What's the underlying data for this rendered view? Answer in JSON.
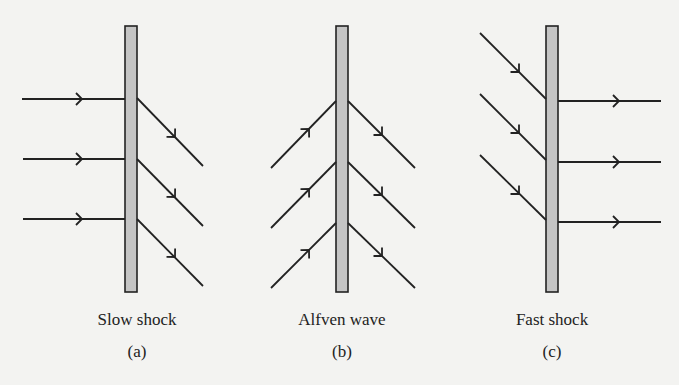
{
  "colors": {
    "background": "#f3f3f1",
    "line": "#222222",
    "bar_fill": "#c4c4c4"
  },
  "panels": [
    {
      "id": "a",
      "title": "Slow shock",
      "tag": "(a)",
      "incoming": "horizontal",
      "outgoing": "diagonal-down"
    },
    {
      "id": "b",
      "title": "Alfven wave",
      "tag": "(b)",
      "incoming": "diagonal-up",
      "outgoing": "diagonal-down"
    },
    {
      "id": "c",
      "title": "Fast shock",
      "tag": "(c)",
      "incoming": "diagonal-down",
      "outgoing": "horizontal"
    }
  ]
}
